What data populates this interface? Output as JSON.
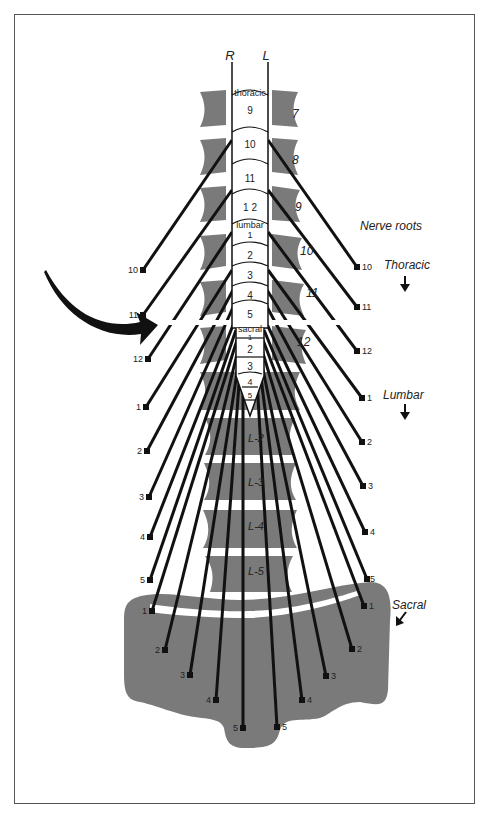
{
  "header": {
    "right_label": "R",
    "left_label": "L"
  },
  "cord": {
    "thoracic_label": "thoracic",
    "lumbar_label": "lumbar",
    "sacral_label": "sacral",
    "segments": [
      {
        "label": "9",
        "y": 110
      },
      {
        "label": "10",
        "y": 145
      },
      {
        "label": "11",
        "y": 178
      },
      {
        "label": "1 2",
        "y": 206
      },
      {
        "label": "1",
        "y": 233
      },
      {
        "label": "2",
        "y": 255
      },
      {
        "label": "3",
        "y": 276
      },
      {
        "label": "4",
        "y": 296
      },
      {
        "label": "5",
        "y": 314
      },
      {
        "label": "1",
        "y": 345
      },
      {
        "label": "2",
        "y": 350
      },
      {
        "label": "3",
        "y": 367
      },
      {
        "label": "4",
        "y": 382
      },
      {
        "label": "5",
        "y": 396
      }
    ]
  },
  "vertebrae_thoracic_labels": [
    "7",
    "8",
    "9",
    "10",
    "11",
    "12"
  ],
  "vertebrae_lumbar_labels": [
    "L-2",
    "L-3",
    "L-4",
    "L-5"
  ],
  "legend": {
    "title": "Nerve roots",
    "thoracic": "Thoracic",
    "lumbar": "Lumbar",
    "sacral": "Sacral"
  },
  "nerve_labels": {
    "thoracic_left": [
      "10",
      "11",
      "12"
    ],
    "thoracic_right": [
      "10",
      "11",
      "12"
    ],
    "lumbar_left": [
      "1",
      "2",
      "3",
      "4",
      "5"
    ],
    "lumbar_right": [
      "1",
      "2",
      "3",
      "4",
      "5"
    ],
    "sacral_left": [
      "1",
      "2",
      "3",
      "4",
      "5"
    ],
    "sacral_right": [
      "1",
      "2",
      "3",
      "4",
      "5"
    ]
  },
  "colors": {
    "bone": "#7a7a7a",
    "line": "#111111",
    "border": "#555555"
  }
}
